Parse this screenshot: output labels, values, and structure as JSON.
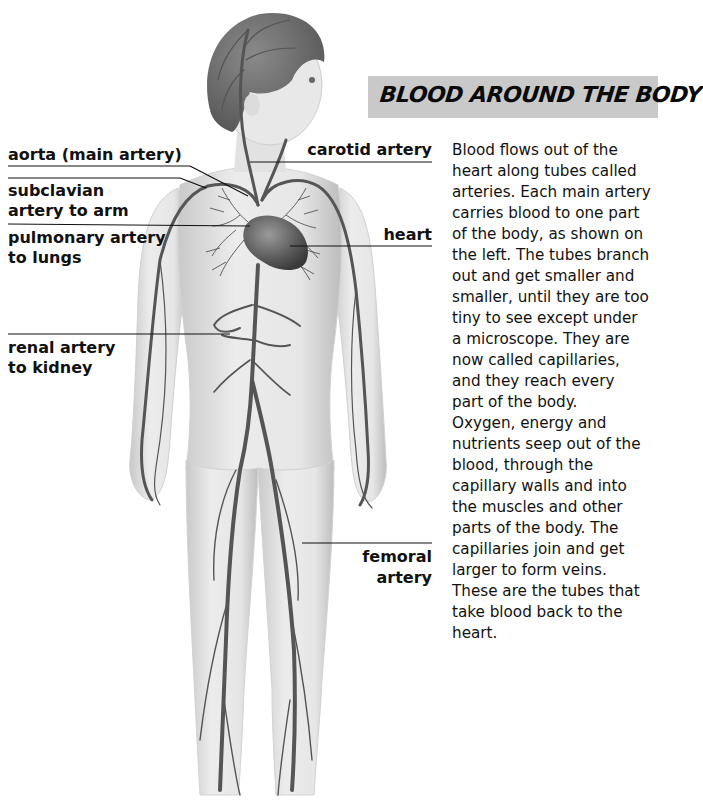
{
  "header": {
    "title": "BLOOD AROUND THE BODY",
    "box_color": "#c9c9c9"
  },
  "labels": {
    "aorta": "aorta (main artery)",
    "subclavian_1": "subclavian",
    "subclavian_2": "artery to arm",
    "pulmonary_1": "pulmonary artery",
    "pulmonary_2": "to lungs",
    "renal_1": "renal artery",
    "renal_2": "to kidney",
    "carotid": "carotid artery",
    "heart": "heart",
    "femoral_1": "femoral",
    "femoral_2": "artery"
  },
  "body_text": {
    "lines": [
      "Blood flows out of the",
      "heart along tubes called",
      "arteries. Each main artery",
      "carries blood to one part",
      "of the body, as shown on",
      "the left. The tubes branch",
      "out and get smaller and",
      "smaller, until they are too",
      "tiny to see except under",
      "a microscope. They are",
      "now called capillaries,",
      "and they reach every",
      "part of the body.",
      "Oxygen, energy and",
      "nutrients seep out of the",
      "blood, through the",
      "capillary walls and into",
      "the muscles and other",
      "parts of the body. The",
      "capillaries join and get",
      "larger to form veins.",
      "These are the tubes that",
      "take blood back to the",
      "heart."
    ]
  },
  "illustration": {
    "subject": "child figure with arterial system",
    "colors": {
      "skin": "#e4e4e4",
      "skin_shadow": "#c8c8c8",
      "hair": "#6a6a6a",
      "artery": "#555555",
      "heart": "#6e6e6e",
      "leader_line": "#111111"
    }
  }
}
